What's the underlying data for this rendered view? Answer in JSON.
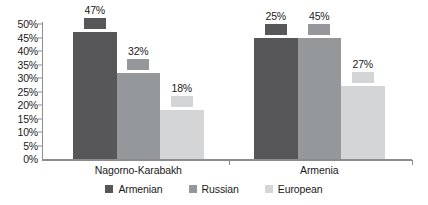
{
  "chart_data": {
    "type": "bar",
    "title": "",
    "subtitle": "",
    "xlabel": "",
    "ylabel": "",
    "categories": [
      "Nagorno-Karabakh",
      "Armenia"
    ],
    "series": [
      {
        "name": "Armenian",
        "color": "#57575a",
        "values": [
          47,
          45
        ]
      },
      {
        "name": "Russian",
        "color": "#95989b",
        "values": [
          32,
          45
        ]
      },
      {
        "name": "European",
        "color": "#d3d5d6",
        "values": [
          18,
          27
        ]
      }
    ],
    "bars": [
      {
        "category": "Nagorno-Karabakh",
        "series": "Armenian",
        "value": 47,
        "label": "47%"
      },
      {
        "category": "Nagorno-Karabakh",
        "series": "Russian",
        "value": 32,
        "label": "32%"
      },
      {
        "category": "Nagorno-Karabakh",
        "series": "European",
        "value": 18,
        "label": "18%"
      },
      {
        "category": "Armenia",
        "series": "Armenian",
        "value": 25,
        "label": "25%"
      },
      {
        "category": "Armenia",
        "series": "Russian",
        "value": 45,
        "label": "45%"
      },
      {
        "category": "Armenia",
        "series": "European",
        "value": 27,
        "label": "27%"
      }
    ],
    "ylim": [
      0,
      50
    ],
    "ytick_step": 5,
    "ytick_labels": [
      "50%",
      "45%",
      "40%",
      "35%",
      "30%",
      "25%",
      "20%",
      "15%",
      "10%",
      "5%",
      "0%"
    ],
    "ytick_values": [
      50,
      45,
      40,
      35,
      30,
      25,
      20,
      15,
      10,
      5,
      0
    ],
    "grid": false,
    "legend_position": "bottom-center",
    "value_labels_shown": true
  },
  "legend": {
    "items": [
      {
        "label": "Armenian",
        "color": "#57575a"
      },
      {
        "label": "Russian",
        "color": "#95989b"
      },
      {
        "label": "European",
        "color": "#d3d5d6"
      }
    ]
  },
  "axis": {
    "line_color": "#8d8d8d"
  }
}
